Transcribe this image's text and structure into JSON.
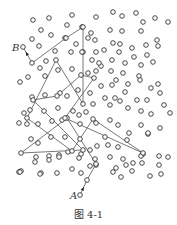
{
  "figure": {
    "caption": "图 4-1",
    "label_start": "A",
    "label_end": "B",
    "stroke_color": "#555555",
    "node_color": "#333333"
  },
  "nodes": [
    [
      33,
      20
    ],
    [
      49,
      18
    ],
    [
      72,
      15
    ],
    [
      41,
      30
    ],
    [
      51,
      35
    ],
    [
      32,
      39
    ],
    [
      39,
      46
    ],
    [
      67,
      25
    ],
    [
      82,
      27
    ],
    [
      96,
      17
    ],
    [
      113,
      12
    ],
    [
      122,
      16
    ],
    [
      136,
      13
    ],
    [
      143,
      22
    ],
    [
      155,
      18
    ],
    [
      168,
      22
    ],
    [
      110,
      30
    ],
    [
      122,
      31
    ],
    [
      141,
      31
    ],
    [
      65,
      38
    ],
    [
      76,
      44
    ],
    [
      88,
      38
    ],
    [
      91,
      33
    ],
    [
      95,
      40
    ],
    [
      113,
      43
    ],
    [
      120,
      44
    ],
    [
      96,
      52
    ],
    [
      104,
      50
    ],
    [
      119,
      52
    ],
    [
      132,
      48
    ],
    [
      146,
      45
    ],
    [
      157,
      40
    ],
    [
      158,
      46
    ],
    [
      147,
      55
    ],
    [
      134,
      57
    ],
    [
      112,
      60
    ],
    [
      101,
      66
    ],
    [
      125,
      63
    ],
    [
      141,
      65
    ],
    [
      153,
      62
    ],
    [
      23,
      47
    ],
    [
      32,
      63
    ],
    [
      40,
      68
    ],
    [
      46,
      61
    ],
    [
      55,
      51
    ],
    [
      71,
      52
    ],
    [
      83,
      52
    ],
    [
      92,
      60
    ],
    [
      99,
      63
    ],
    [
      82,
      52
    ],
    [
      20,
      82
    ],
    [
      28,
      77
    ],
    [
      45,
      76
    ],
    [
      58,
      70
    ],
    [
      72,
      69
    ],
    [
      88,
      73
    ],
    [
      96,
      71
    ],
    [
      111,
      71
    ],
    [
      123,
      73
    ],
    [
      139,
      76
    ],
    [
      101,
      86
    ],
    [
      112,
      85
    ],
    [
      116,
      80
    ],
    [
      128,
      84
    ],
    [
      140,
      80
    ],
    [
      151,
      88
    ],
    [
      158,
      84
    ],
    [
      32,
      97
    ],
    [
      45,
      95
    ],
    [
      60,
      93
    ],
    [
      67,
      96
    ],
    [
      78,
      90
    ],
    [
      90,
      93
    ],
    [
      105,
      98
    ],
    [
      115,
      98
    ],
    [
      125,
      92
    ],
    [
      137,
      100
    ],
    [
      147,
      100
    ],
    [
      160,
      93
    ],
    [
      24,
      113
    ],
    [
      30,
      110
    ],
    [
      44,
      111
    ],
    [
      58,
      108
    ],
    [
      73,
      111
    ],
    [
      79,
      115
    ],
    [
      86,
      112
    ],
    [
      93,
      104
    ],
    [
      110,
      105
    ],
    [
      120,
      101
    ],
    [
      128,
      108
    ],
    [
      141,
      111
    ],
    [
      151,
      114
    ],
    [
      164,
      105
    ],
    [
      170,
      113
    ],
    [
      19,
      123
    ],
    [
      27,
      124
    ],
    [
      38,
      124
    ],
    [
      52,
      121
    ],
    [
      62,
      120
    ],
    [
      80,
      124
    ],
    [
      96,
      123
    ],
    [
      110,
      120
    ],
    [
      118,
      125
    ],
    [
      129,
      133
    ],
    [
      141,
      125
    ],
    [
      148,
      134
    ],
    [
      160,
      128
    ],
    [
      31,
      139
    ],
    [
      38,
      143
    ],
    [
      51,
      137
    ],
    [
      65,
      137
    ],
    [
      80,
      139
    ],
    [
      90,
      150
    ],
    [
      105,
      137
    ],
    [
      127,
      140
    ],
    [
      148,
      133
    ],
    [
      21,
      153
    ],
    [
      36,
      157
    ],
    [
      49,
      156
    ],
    [
      59,
      155
    ],
    [
      68,
      152
    ],
    [
      81,
      154
    ],
    [
      97,
      146
    ],
    [
      108,
      145
    ],
    [
      118,
      147
    ],
    [
      143,
      154
    ],
    [
      35,
      162
    ],
    [
      49,
      160
    ],
    [
      59,
      157
    ],
    [
      79,
      158
    ],
    [
      95,
      159
    ],
    [
      110,
      157
    ],
    [
      123,
      159
    ],
    [
      141,
      156
    ],
    [
      159,
      156
    ],
    [
      21,
      171
    ],
    [
      41,
      173
    ],
    [
      57,
      173
    ],
    [
      72,
      169
    ],
    [
      81,
      173
    ],
    [
      96,
      165
    ],
    [
      116,
      168
    ],
    [
      126,
      165
    ],
    [
      142,
      163
    ],
    [
      159,
      165
    ],
    [
      168,
      157
    ],
    [
      19,
      172
    ],
    [
      20,
      172
    ],
    [
      40,
      174
    ],
    [
      90,
      166
    ],
    [
      113,
      172
    ],
    [
      132,
      171
    ],
    [
      150,
      176
    ],
    [
      121,
      177
    ],
    [
      133,
      163
    ],
    [
      161,
      174
    ],
    [
      80,
      195
    ]
  ],
  "path": [
    [
      80,
      195
    ],
    [
      87,
      180
    ],
    [
      96,
      164
    ],
    [
      67,
      118
    ],
    [
      21,
      153
    ],
    [
      83,
      150
    ],
    [
      33,
      100
    ],
    [
      57,
      96
    ],
    [
      81,
      75
    ],
    [
      94,
      78
    ],
    [
      65,
      118
    ],
    [
      143,
      153
    ],
    [
      93,
      119
    ],
    [
      72,
      151
    ],
    [
      27,
      118
    ],
    [
      56,
      60
    ],
    [
      83,
      104
    ],
    [
      83,
      27
    ],
    [
      66,
      38
    ],
    [
      32,
      63
    ],
    [
      23,
      47
    ]
  ]
}
